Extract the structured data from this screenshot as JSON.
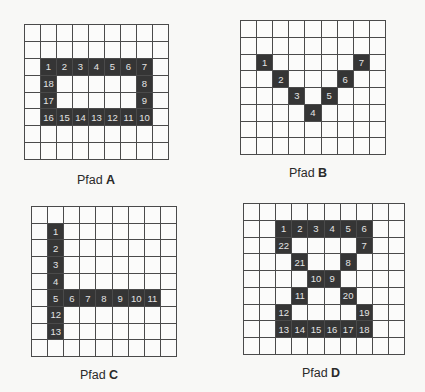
{
  "colors": {
    "path_cell": "#353535",
    "path_number": "#e4e4e4",
    "grid_line": "#4a4a4a",
    "background": "#f8f8f6"
  },
  "panels": [
    {
      "id": "A",
      "label_prefix": "Pfad",
      "label_letter": "A",
      "cols": 9,
      "rows": 8,
      "box": {
        "x": 24,
        "y": 24,
        "w": 145,
        "h": 136
      },
      "label_pos": {
        "x": 96,
        "y": 173
      },
      "path": [
        {
          "n": "1",
          "r": 2,
          "c": 1
        },
        {
          "n": "2",
          "r": 2,
          "c": 2
        },
        {
          "n": "3",
          "r": 2,
          "c": 3
        },
        {
          "n": "4",
          "r": 2,
          "c": 4
        },
        {
          "n": "5",
          "r": 2,
          "c": 5
        },
        {
          "n": "6",
          "r": 2,
          "c": 6
        },
        {
          "n": "7",
          "r": 2,
          "c": 7
        },
        {
          "n": "8",
          "r": 3,
          "c": 7
        },
        {
          "n": "9",
          "r": 4,
          "c": 7
        },
        {
          "n": "10",
          "r": 5,
          "c": 7
        },
        {
          "n": "11",
          "r": 5,
          "c": 6
        },
        {
          "n": "12",
          "r": 5,
          "c": 5
        },
        {
          "n": "13",
          "r": 5,
          "c": 4
        },
        {
          "n": "14",
          "r": 5,
          "c": 3
        },
        {
          "n": "15",
          "r": 5,
          "c": 2
        },
        {
          "n": "16",
          "r": 5,
          "c": 1
        },
        {
          "n": "17",
          "r": 4,
          "c": 1
        },
        {
          "n": "18",
          "r": 3,
          "c": 1
        }
      ]
    },
    {
      "id": "B",
      "label_prefix": "Pfad",
      "label_letter": "B",
      "cols": 9,
      "rows": 8,
      "box": {
        "x": 240,
        "y": 20,
        "w": 146,
        "h": 135
      },
      "label_pos": {
        "x": 308,
        "y": 166
      },
      "path": [
        {
          "n": "1",
          "r": 2,
          "c": 1
        },
        {
          "n": "2",
          "r": 3,
          "c": 2
        },
        {
          "n": "3",
          "r": 4,
          "c": 3
        },
        {
          "n": "4",
          "r": 5,
          "c": 4
        },
        {
          "n": "5",
          "r": 4,
          "c": 5
        },
        {
          "n": "6",
          "r": 3,
          "c": 6
        },
        {
          "n": "7",
          "r": 2,
          "c": 7
        }
      ]
    },
    {
      "id": "C",
      "label_prefix": "Pfad",
      "label_letter": "C",
      "cols": 9,
      "rows": 9,
      "box": {
        "x": 31,
        "y": 206,
        "w": 146,
        "h": 151
      },
      "label_pos": {
        "x": 99,
        "y": 368
      },
      "path": [
        {
          "n": "1",
          "r": 1,
          "c": 1
        },
        {
          "n": "2",
          "r": 2,
          "c": 1
        },
        {
          "n": "3",
          "r": 3,
          "c": 1
        },
        {
          "n": "4",
          "r": 4,
          "c": 1
        },
        {
          "n": "5",
          "r": 5,
          "c": 1
        },
        {
          "n": "6",
          "r": 5,
          "c": 2
        },
        {
          "n": "7",
          "r": 5,
          "c": 3
        },
        {
          "n": "8",
          "r": 5,
          "c": 4
        },
        {
          "n": "9",
          "r": 5,
          "c": 5
        },
        {
          "n": "10",
          "r": 5,
          "c": 6
        },
        {
          "n": "11",
          "r": 5,
          "c": 7
        },
        {
          "n": "12",
          "r": 6,
          "c": 1
        },
        {
          "n": "13",
          "r": 7,
          "c": 1
        }
      ]
    },
    {
      "id": "D",
      "label_prefix": "Pfad",
      "label_letter": "D",
      "cols": 10,
      "rows": 9,
      "box": {
        "x": 243,
        "y": 203,
        "w": 162,
        "h": 152
      },
      "label_pos": {
        "x": 321,
        "y": 366
      },
      "path": [
        {
          "n": "1",
          "r": 1,
          "c": 2
        },
        {
          "n": "2",
          "r": 1,
          "c": 3
        },
        {
          "n": "3",
          "r": 1,
          "c": 4
        },
        {
          "n": "4",
          "r": 1,
          "c": 5
        },
        {
          "n": "5",
          "r": 1,
          "c": 6
        },
        {
          "n": "6",
          "r": 1,
          "c": 7
        },
        {
          "n": "7",
          "r": 2,
          "c": 7
        },
        {
          "n": "8",
          "r": 3,
          "c": 6
        },
        {
          "n": "9",
          "r": 4,
          "c": 5
        },
        {
          "n": "10",
          "r": 4,
          "c": 4
        },
        {
          "n": "11",
          "r": 5,
          "c": 3
        },
        {
          "n": "12",
          "r": 6,
          "c": 2
        },
        {
          "n": "13",
          "r": 7,
          "c": 2
        },
        {
          "n": "14",
          "r": 7,
          "c": 3
        },
        {
          "n": "15",
          "r": 7,
          "c": 4
        },
        {
          "n": "16",
          "r": 7,
          "c": 5
        },
        {
          "n": "17",
          "r": 7,
          "c": 6
        },
        {
          "n": "18",
          "r": 7,
          "c": 7
        },
        {
          "n": "19",
          "r": 6,
          "c": 7
        },
        {
          "n": "20",
          "r": 5,
          "c": 6
        },
        {
          "n": "21",
          "r": 3,
          "c": 3
        },
        {
          "n": "22",
          "r": 2,
          "c": 2
        }
      ]
    }
  ]
}
